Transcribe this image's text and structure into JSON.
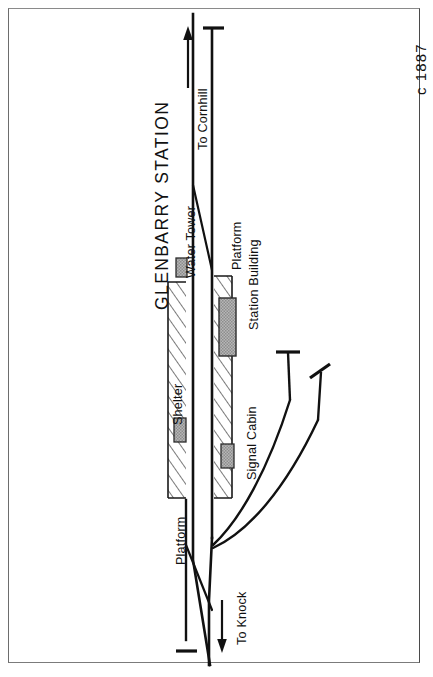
{
  "document": {
    "kind": "railway-station-track-plan",
    "title": "GLENBARRY STATION",
    "date_note": "c 1887",
    "orientation_note": "plan drawn sideways; all lettering rotated 90 degrees"
  },
  "labels": {
    "title": "GLENBARRY STATION",
    "date": "c 1887",
    "water_tower": "Water Tower",
    "shelter": "Shelter",
    "platform_up": "Platform",
    "platform_down": "Platform",
    "station_building": "Station Building",
    "signal_cabin": "Signal Cabin",
    "to_cornhill": "To Cornhill",
    "to_knock": "To Knock"
  },
  "features": [
    {
      "name": "water-tower",
      "label": "Water Tower",
      "type": "building",
      "fill": "#a9a9a9"
    },
    {
      "name": "shelter",
      "label": "Shelter",
      "type": "building",
      "fill": "#a9a9a9"
    },
    {
      "name": "station-building",
      "label": "Station Building",
      "type": "building",
      "fill": "#a9a9a9"
    },
    {
      "name": "signal-cabin",
      "label": "Signal Cabin",
      "type": "building",
      "fill": "#a9a9a9"
    },
    {
      "name": "up-platform",
      "label": "Platform",
      "type": "platform",
      "hatched": true
    },
    {
      "name": "down-platform",
      "label": "Platform",
      "type": "platform",
      "hatched": true
    }
  ],
  "tracks": [
    {
      "name": "up-main-line",
      "destination_north": "To Cornhill",
      "destination_south": "To Knock"
    },
    {
      "name": "down-main-line",
      "destination_north": "To Cornhill",
      "destination_south": "To Knock"
    },
    {
      "name": "siding-upper",
      "terminates_in": "buffer-stop"
    },
    {
      "name": "siding-lower",
      "terminates_in": "buffer-stop"
    },
    {
      "name": "crossover",
      "connects": "up-main-line to down-main-line"
    }
  ],
  "direction_arrows": [
    {
      "name": "arrow-to-cornhill",
      "label": "To Cornhill",
      "points": "north"
    },
    {
      "name": "arrow-to-knock",
      "label": "To Knock",
      "points": "south"
    }
  ],
  "colors": {
    "ink": "#111111",
    "building_fill": "#a9a9a9",
    "platform_line": "#1a1a1a",
    "paper": "#ffffff",
    "frame": "#6d6d6d"
  }
}
